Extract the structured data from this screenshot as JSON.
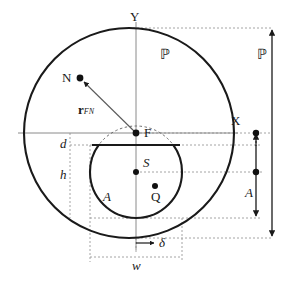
{
  "figure": {
    "background_color": "#ffffff",
    "stroke_color": "#1a1a1a",
    "axis_color": "#8a8a8a",
    "guide_color": "#9a9a9a"
  },
  "axes": {
    "x_label": "X",
    "y_label": "Y"
  },
  "points": [
    {
      "name": "F",
      "label": "F",
      "x": 136,
      "y": 133
    },
    {
      "name": "N",
      "label": "N",
      "x": 80,
      "y": 78
    },
    {
      "name": "S",
      "label": "S",
      "x": 136,
      "y": 172
    },
    {
      "name": "Q",
      "label": "Q",
      "x": 155,
      "y": 186
    }
  ],
  "region_labels": {
    "outer_domain": "ℙ",
    "inner_area": "A"
  },
  "vector": {
    "label_main": "r",
    "label_sub": "FN",
    "from": "F",
    "to": "N"
  },
  "dimensions": {
    "d": "d",
    "h": "h",
    "w": "w",
    "delta": "δ",
    "A": "A",
    "P": "ℙ"
  },
  "shapes": {
    "outer_circle": {
      "cx": 129,
      "cy": 133,
      "r": 105
    },
    "inner_circle": {
      "cx": 136,
      "cy": 172,
      "r": 46
    },
    "dashed_circle": {
      "cx": 136,
      "cy": 172,
      "r": 46
    },
    "chord_y": 145
  }
}
